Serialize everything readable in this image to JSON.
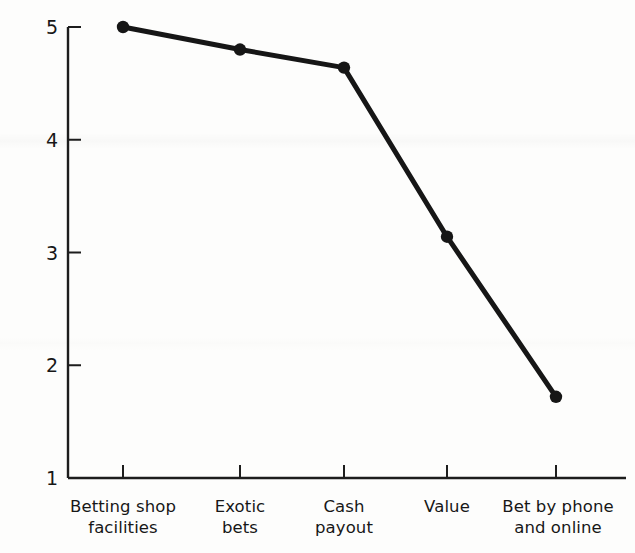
{
  "chart_data": {
    "type": "line",
    "title": "",
    "subtitle": "",
    "xlabel": "",
    "ylabel": "Importance",
    "categories": [
      "Betting shop\nfacilities",
      "Exotic\nbets",
      "Cash\npayout",
      "Value",
      "Bet by phone\nand online"
    ],
    "values": [
      5.0,
      4.8,
      4.64,
      3.14,
      1.72
    ],
    "series": [
      {
        "name": "Importance",
        "values": [
          5.0,
          4.8,
          4.64,
          3.14,
          1.72
        ]
      }
    ],
    "ylim": [
      1,
      5
    ],
    "yticks": [
      1,
      2,
      3,
      4,
      5
    ],
    "ytick_labels": [
      "1",
      "2",
      "3",
      "4",
      "5"
    ],
    "grid": false,
    "legend": false,
    "legend_position": "none",
    "marker": "circle",
    "line_color": "#161616",
    "marker_color": "#161616",
    "background_color": "#fdfdfc"
  }
}
